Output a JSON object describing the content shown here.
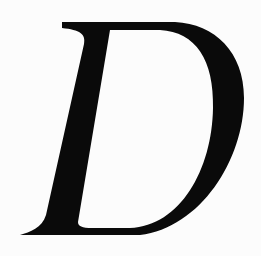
{
  "document": {
    "drop_cap": {
      "letter": "D",
      "style": "italic serif",
      "color": "#0a0a0a"
    },
    "bleed_through_lines": [
      "",
      "",
      "",
      "",
      "",
      "",
      "",
      "",
      "",
      ""
    ],
    "background_color": "#fcfcfc"
  }
}
